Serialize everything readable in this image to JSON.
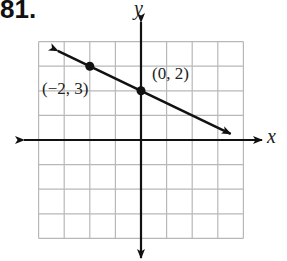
{
  "problem": {
    "number_label": "81."
  },
  "chart_data": {
    "type": "line",
    "title": "",
    "xlabel": "x",
    "ylabel": "y",
    "xlim": [
      -4,
      4
    ],
    "ylim": [
      -4,
      4
    ],
    "grid": true,
    "grid_step": 1,
    "series": [
      {
        "name": "line",
        "equation": "y = -1/2 x + 2",
        "slope": -0.5,
        "intercept": 2,
        "arrows": "both",
        "points": [
          {
            "x": -2,
            "y": 3,
            "label": "(-2, 3)"
          },
          {
            "x": 0,
            "y": 2,
            "label": "(0, 2)"
          }
        ]
      }
    ]
  },
  "labels": {
    "point_a": "(−2, 3)",
    "point_b": "(0, 2)",
    "x_axis": "x",
    "y_axis": "y"
  },
  "colors": {
    "grid": "#b8b8b8",
    "axis": "#111111",
    "line": "#111111"
  }
}
